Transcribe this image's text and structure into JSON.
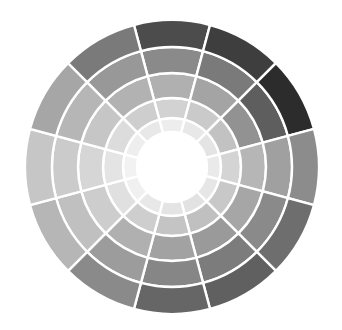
{
  "wheel": {
    "title": "Grayscale color wheel",
    "center": [
      172,
      167
    ],
    "segment_count": 12,
    "start_angle_offset_deg": -15,
    "ring_radii": [
      35,
      49,
      69,
      94,
      120,
      147
    ],
    "center_color": "#ffffff",
    "rings": [
      {
        "name": "ring-1-innermost",
        "colors": [
          "#ededed",
          "#e8e8e8",
          "#e4e4e4",
          "#eaeaea",
          "#e6e6e6",
          "#e2e2e2",
          "#e4e4e4",
          "#e8e8e8",
          "#f0f0f0",
          "#f2f2f2",
          "#eeeeee",
          "#e8e8e8"
        ]
      },
      {
        "name": "ring-2",
        "colors": [
          "#d2d2d2",
          "#cacaca",
          "#c2c2c2",
          "#d4d4d4",
          "#c8c8c8",
          "#c0c0c0",
          "#c4c4c4",
          "#cecece",
          "#e0e0e0",
          "#e4e4e4",
          "#dcdcdc",
          "#cecece"
        ]
      },
      {
        "name": "ring-3",
        "colors": [
          "#b0b0b0",
          "#a4a4a4",
          "#929292",
          "#b6b6b6",
          "#a6a6a6",
          "#9a9a9a",
          "#a2a2a2",
          "#b0b0b0",
          "#cdcdcd",
          "#d6d6d6",
          "#c6c6c6",
          "#b2b2b2"
        ]
      },
      {
        "name": "ring-4",
        "colors": [
          "#8a8a8a",
          "#7a7a7a",
          "#5e5e5e",
          "#a0a0a0",
          "#8a8a8a",
          "#7c7c7c",
          "#868686",
          "#9c9c9c",
          "#c0c0c0",
          "#cbcbcb",
          "#b6b6b6",
          "#989898"
        ]
      },
      {
        "name": "ring-5-outer",
        "colors": [
          "#4c4c4c",
          "#3e3e3e",
          "#2c2c2c",
          "#8c8c8c",
          "#6e6e6e",
          "#606060",
          "#666666",
          "#8a8a8a",
          "#b6b6b6",
          "#c6c6c6",
          "#a6a6a6",
          "#7a7a7a"
        ]
      }
    ],
    "separator_color": "#ffffff"
  }
}
